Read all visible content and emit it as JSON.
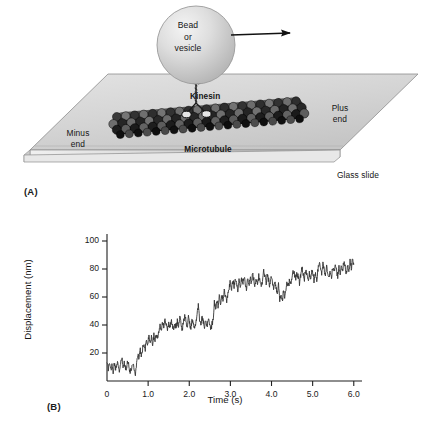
{
  "figure": {
    "panel_a": {
      "letter": "(A)",
      "labels": {
        "bead": "Bead\nor\nvesicle",
        "kinesin": "Kinesin",
        "minus_end": "Minus\nend",
        "plus_end": "Plus\nend",
        "microtubule": "Microtubule",
        "glass_slide": "Glass slide"
      },
      "icons": {
        "direction_arrow": "arrow-right-icon",
        "bead": "bead-sphere-icon",
        "kinesin_motor": "kinesin-motor-icon",
        "microtubule": "microtubule-filament-icon",
        "glass_slide": "glass-slide-icon"
      },
      "colors": {
        "slide_fill": "#d8d8d8",
        "slide_edge": "#9a9a9a",
        "bead_fill": "#cfcfcf",
        "bead_highlight": "#f2f2f2",
        "tubulin_dark": "#2b2b2b",
        "tubulin_light": "#7d7d7d"
      }
    },
    "panel_b": {
      "letter": "(B)"
    }
  },
  "chart_data": {
    "type": "line",
    "title": "",
    "xlabel": "Time (s)",
    "ylabel": "Displacement (nm)",
    "xlim": [
      0,
      6.2
    ],
    "ylim": [
      0,
      105
    ],
    "xticks": [
      0,
      1.0,
      2.0,
      3.0,
      4.0,
      5.0,
      6.0
    ],
    "xtick_labels": [
      "0",
      "1.0",
      "2.0",
      "3.0",
      "4.0",
      "5.0",
      "6.0"
    ],
    "yticks": [
      20,
      40,
      60,
      80,
      100
    ],
    "ytick_labels": [
      "20",
      "40",
      "60",
      "80",
      "100"
    ],
    "grid": false,
    "legend": null,
    "line_color": "#333333",
    "line_width": 0.9,
    "steps": [
      {
        "t_start": 0.0,
        "t_end": 0.62,
        "level": 10
      },
      {
        "t_start": 0.62,
        "t_end": 0.8,
        "level": 22
      },
      {
        "t_start": 0.8,
        "t_end": 1.18,
        "level": 31
      },
      {
        "t_start": 1.18,
        "t_end": 2.02,
        "level": 40
      },
      {
        "t_start": 2.02,
        "t_end": 2.35,
        "level": 58
      },
      {
        "t_start": 2.35,
        "t_end": 3.08,
        "level": 68
      },
      {
        "t_start": 3.08,
        "t_end": 3.25,
        "level": 62
      },
      {
        "t_start": 3.25,
        "t_end": 4.05,
        "level": 75
      },
      {
        "t_start": 4.05,
        "t_end": 5.3,
        "level": 81
      },
      {
        "t_start": 5.3,
        "t_end": 6.0,
        "level": 90
      }
    ],
    "x": [
      0.0,
      0.03,
      0.06,
      0.09,
      0.12,
      0.15,
      0.18,
      0.21,
      0.24,
      0.27,
      0.3,
      0.33,
      0.36,
      0.39,
      0.42,
      0.45,
      0.48,
      0.51,
      0.54,
      0.57,
      0.6,
      0.63,
      0.66,
      0.69,
      0.72,
      0.75,
      0.78,
      0.81,
      0.84,
      0.87,
      0.9,
      0.93,
      0.96,
      0.99,
      1.02,
      1.05,
      1.08,
      1.11,
      1.14,
      1.17,
      1.2,
      1.23,
      1.26,
      1.29,
      1.32,
      1.35,
      1.38,
      1.41,
      1.44,
      1.47,
      1.5,
      1.53,
      1.56,
      1.59,
      1.62,
      1.65,
      1.68,
      1.71,
      1.74,
      1.77,
      1.8,
      1.83,
      1.86,
      1.89,
      1.92,
      1.95,
      1.98,
      2.01,
      2.04,
      2.07,
      2.1,
      2.13,
      2.16,
      2.19,
      2.22,
      2.25,
      2.28,
      2.31,
      2.34,
      2.37,
      2.4,
      2.43,
      2.46,
      2.49,
      2.52,
      2.55,
      2.58,
      2.61,
      2.64,
      2.67,
      2.7,
      2.73,
      2.76,
      2.79,
      2.82,
      2.85,
      2.88,
      2.91,
      2.94,
      2.97,
      3.0,
      3.03,
      3.06,
      3.09,
      3.12,
      3.15,
      3.18,
      3.21,
      3.24,
      3.27,
      3.3,
      3.33,
      3.36,
      3.39,
      3.42,
      3.45,
      3.48,
      3.51,
      3.54,
      3.57,
      3.6,
      3.63,
      3.66,
      3.69,
      3.72,
      3.75,
      3.78,
      3.81,
      3.84,
      3.87,
      3.9,
      3.93,
      3.96,
      3.99,
      4.02,
      4.05,
      4.08,
      4.11,
      4.14,
      4.17,
      4.2,
      4.23,
      4.26,
      4.29,
      4.32,
      4.35,
      4.38,
      4.41,
      4.44,
      4.47,
      4.5,
      4.53,
      4.56,
      4.59,
      4.62,
      4.65,
      4.68,
      4.71,
      4.74,
      4.77,
      4.8,
      4.83,
      4.86,
      4.89,
      4.92,
      4.95,
      4.98,
      5.01,
      5.04,
      5.07,
      5.1,
      5.13,
      5.16,
      5.19,
      5.22,
      5.25,
      5.28,
      5.31,
      5.34,
      5.37,
      5.4,
      5.43,
      5.46,
      5.49,
      5.52,
      5.55,
      5.58,
      5.61,
      5.64,
      5.67,
      5.7,
      5.73,
      5.76,
      5.79,
      5.82,
      5.85,
      5.88,
      5.91,
      5.94,
      5.97,
      6.0
    ],
    "y": [
      12,
      9,
      13,
      8,
      11,
      7,
      12,
      9,
      14,
      10,
      7,
      12,
      16,
      10,
      13,
      8,
      11,
      15,
      9,
      6,
      10,
      13,
      9,
      5,
      12,
      20,
      16,
      22,
      18,
      24,
      27,
      23,
      30,
      26,
      32,
      28,
      31,
      27,
      33,
      29,
      34,
      30,
      36,
      41,
      37,
      43,
      39,
      44,
      40,
      37,
      42,
      38,
      44,
      40,
      36,
      41,
      37,
      43,
      39,
      45,
      41,
      37,
      42,
      47,
      43,
      39,
      45,
      41,
      38,
      44,
      40,
      36,
      42,
      48,
      54,
      44,
      40,
      46,
      42,
      38,
      43,
      39,
      45,
      41,
      37,
      40,
      44,
      56,
      52,
      58,
      54,
      60,
      56,
      62,
      58,
      64,
      60,
      57,
      62,
      67,
      71,
      66,
      72,
      68,
      74,
      70,
      65,
      71,
      67,
      73,
      69,
      75,
      71,
      66,
      72,
      68,
      74,
      70,
      76,
      72,
      68,
      73,
      69,
      75,
      71,
      66,
      72,
      78,
      74,
      70,
      76,
      72,
      68,
      74,
      70,
      66,
      71,
      67,
      63,
      69,
      58,
      62,
      57,
      64,
      60,
      66,
      71,
      67,
      73,
      69,
      75,
      80,
      76,
      72,
      78,
      74,
      70,
      76,
      81,
      77,
      73,
      79,
      75,
      71,
      77,
      73,
      79,
      75,
      71,
      77,
      73,
      79,
      85,
      81,
      77,
      83,
      79,
      75,
      81,
      77,
      73,
      79,
      75,
      81,
      77,
      83,
      79,
      75,
      81,
      77,
      83,
      79,
      85,
      81,
      77,
      83,
      79,
      85,
      81,
      87,
      83,
      79,
      85,
      81,
      87,
      83,
      79,
      85,
      81,
      77,
      83,
      79,
      85,
      81,
      77,
      83,
      79,
      85,
      81,
      87,
      83,
      79,
      85,
      81,
      87,
      83,
      89,
      85,
      81,
      87,
      83,
      79,
      85,
      81,
      87,
      83,
      89,
      85,
      81,
      87,
      83,
      79,
      85,
      81,
      87,
      83,
      89,
      85,
      81,
      87,
      83,
      89,
      85,
      91,
      87,
      83,
      89,
      85,
      91,
      87,
      83,
      89,
      85,
      91,
      87,
      93,
      89,
      85,
      91,
      97,
      93,
      89,
      95,
      91,
      97,
      93,
      89,
      95,
      98
    ]
  }
}
